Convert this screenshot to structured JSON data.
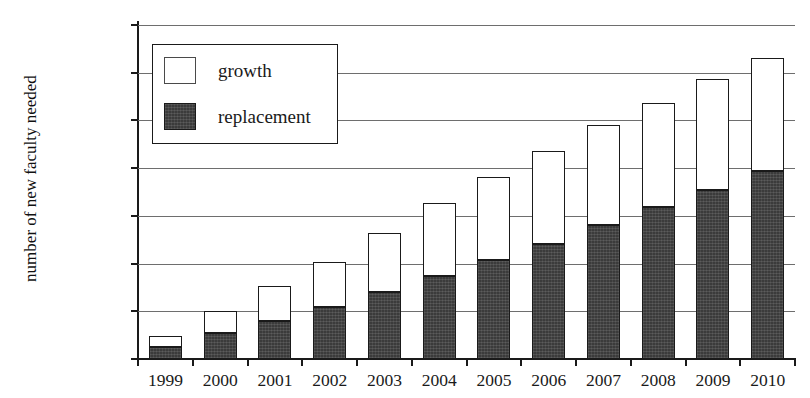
{
  "chart_data": {
    "type": "bar",
    "subtype": "stacked-bar",
    "title": "",
    "xlabel": "",
    "ylabel": "number of new faculty needed",
    "ylim": [
      0,
      35000
    ],
    "ytick_values": [
      0,
      5000,
      10000,
      15000,
      20000,
      25000,
      30000,
      35000
    ],
    "ytick_labels": [
      "0",
      "5,000",
      "10,000",
      "15,000",
      "20,000",
      "25,000",
      "30,000",
      "35,000"
    ],
    "grid": true,
    "grid_axis": "y",
    "legend_position": "upper left",
    "categories": [
      "1999",
      "2000",
      "2001",
      "2002",
      "2003",
      "2004",
      "2005",
      "2006",
      "2007",
      "2008",
      "2009",
      "2010"
    ],
    "series": [
      {
        "name": "replacement",
        "color": "#3b3b3b",
        "values": [
          1250,
          2700,
          4000,
          5500,
          7000,
          8700,
          10400,
          12100,
          14000,
          15900,
          17700,
          19700
        ]
      },
      {
        "name": "growth",
        "color": "#ffffff",
        "values": [
          1150,
          2300,
          3650,
          4700,
          6200,
          7600,
          8700,
          9700,
          10500,
          10900,
          11600,
          11800
        ]
      }
    ],
    "totals": [
      2400,
      5000,
      7650,
      10200,
      13200,
      16300,
      19100,
      21800,
      24500,
      26800,
      29300,
      31500
    ]
  },
  "axis": {
    "ylabel": "number of new faculty needed",
    "ytick_labels": [
      "35,000",
      "30,000",
      "25,000",
      "20,000",
      "15,000",
      "10,000",
      "5,000",
      "0"
    ],
    "xtick_labels": [
      "1999",
      "2000",
      "2001",
      "2002",
      "2003",
      "2004",
      "2005",
      "2006",
      "2007",
      "2008",
      "2009",
      "2010"
    ]
  },
  "legend": {
    "items": [
      {
        "label": "growth",
        "swatch": "white-square"
      },
      {
        "label": "replacement",
        "swatch": "dark-filled-square"
      }
    ]
  },
  "title_remnant": ""
}
